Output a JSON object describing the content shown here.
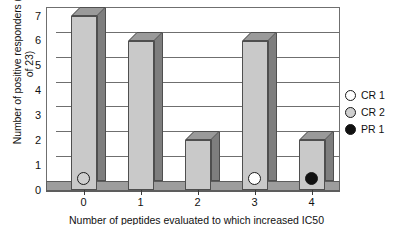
{
  "chart_data": {
    "type": "bar",
    "title": "",
    "xlabel": "Number of peptides evaluated to which increased IC50",
    "ylabel": "Number of positive responders (out of 23)",
    "categories": [
      "0",
      "1",
      "2",
      "3",
      "4"
    ],
    "values": [
      7,
      6,
      2,
      6,
      2
    ],
    "ylim": [
      0,
      7
    ],
    "yticks": [
      "0",
      "1",
      "2",
      "3",
      "4",
      "5",
      "6",
      "7"
    ],
    "grid": true,
    "legend_position": "right",
    "style": "3d-bar-grayscale",
    "series": [
      {
        "name": "positive responders",
        "values": [
          7,
          6,
          2,
          6,
          2
        ]
      }
    ],
    "annotations": [
      {
        "label": "CR 2",
        "category": "0",
        "marker": "circle-gray"
      },
      {
        "label": "CR 1",
        "category": "3",
        "marker": "circle-white"
      },
      {
        "label": "PR 1",
        "category": "4",
        "marker": "circle-black"
      }
    ],
    "legend": [
      {
        "label": "CR 1",
        "color": "#ffffff"
      },
      {
        "label": "CR 2",
        "color": "#cfcfcf"
      },
      {
        "label": "PR 1",
        "color": "#111111"
      }
    ],
    "colors": {
      "bar_face": "#c9c9c9",
      "bar_side": "#7e7e7e",
      "bar_top": "#9a9a9a",
      "floor": "#9d9d9d",
      "axis": "#6f6f6f",
      "background": "#ffffff"
    }
  }
}
